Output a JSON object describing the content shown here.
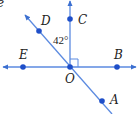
{
  "diagram": {
    "title_fragment": "e",
    "colors": {
      "line": "#4a7fd8",
      "point": "#1f4fc9",
      "text": "#222222"
    },
    "points": [
      {
        "id": "D",
        "label": "D"
      },
      {
        "id": "C",
        "label": "C"
      },
      {
        "id": "E",
        "label": "E"
      },
      {
        "id": "B",
        "label": "B"
      },
      {
        "id": "O",
        "label": "O"
      },
      {
        "id": "A",
        "label": "A"
      }
    ],
    "angle_label": "42°",
    "right_angle_at": "O",
    "lines": [
      {
        "name": "line EB",
        "type": "line"
      },
      {
        "name": "ray OC",
        "type": "ray"
      },
      {
        "name": "line DA",
        "type": "line"
      }
    ]
  }
}
